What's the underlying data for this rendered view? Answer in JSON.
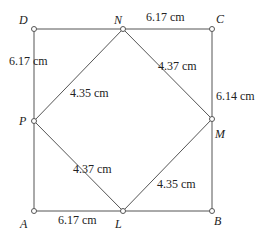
{
  "diagram": {
    "points": {
      "A": {
        "label": "A"
      },
      "B": {
        "label": "B"
      },
      "C": {
        "label": "C"
      },
      "D": {
        "label": "D"
      },
      "L": {
        "label": "L"
      },
      "M": {
        "label": "M"
      },
      "N": {
        "label": "N"
      },
      "P": {
        "label": "P"
      }
    },
    "measurements": {
      "NC": "6.17 cm",
      "DP": "6.17 cm",
      "CM": "6.14 cm",
      "AL": "6.17 cm",
      "PN": "4.35 cm",
      "NM": "4.37 cm",
      "PL": "4.37 cm",
      "LM": "4.35 cm"
    }
  }
}
